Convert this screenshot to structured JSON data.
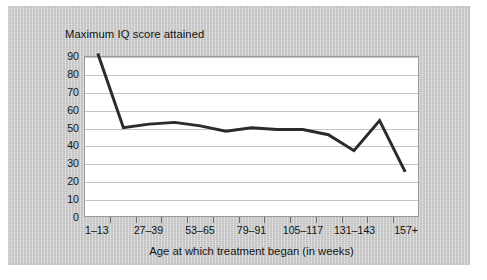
{
  "chart_data": {
    "type": "line",
    "title": "Maximum IQ score attained",
    "xlabel": "Age at which treatment began (in weeks)",
    "ylabel": "Maximum IQ score attained",
    "ylim": [
      0,
      90
    ],
    "ytick_step": 10,
    "yticks": [
      90,
      80,
      70,
      60,
      50,
      40,
      30,
      20,
      10,
      0
    ],
    "grid": true,
    "legend": "none",
    "line_color": "#2b2b2b",
    "line_width": 3,
    "categories": [
      "1–13",
      "14–26",
      "27–39",
      "40–52",
      "53–65",
      "66–78",
      "79–91",
      "92–104",
      "105–117",
      "118–130",
      "131–143",
      "144–156",
      "157+"
    ],
    "xtick_labels_visible": [
      "1–13",
      "27–39",
      "53–65",
      "79–91",
      "105–117",
      "131–143",
      "157+"
    ],
    "values": [
      92,
      50,
      52,
      53,
      51,
      48,
      50,
      49,
      49,
      46,
      37,
      54,
      25
    ],
    "series": [
      {
        "name": "Maximum IQ score attained",
        "values": [
          92,
          50,
          52,
          53,
          51,
          48,
          50,
          49,
          49,
          46,
          37,
          54,
          25
        ]
      }
    ],
    "points": [
      {
        "x": "1–13",
        "y": 92
      },
      {
        "x": "14–26",
        "y": 50
      },
      {
        "x": "27–39",
        "y": 52
      },
      {
        "x": "40–52",
        "y": 53
      },
      {
        "x": "53–65",
        "y": 51
      },
      {
        "x": "66–78",
        "y": 48
      },
      {
        "x": "79–91",
        "y": 50
      },
      {
        "x": "92–104",
        "y": 49
      },
      {
        "x": "105–117",
        "y": 49
      },
      {
        "x": "118–130",
        "y": 46
      },
      {
        "x": "131–143",
        "y": 37
      },
      {
        "x": "144–156",
        "y": 54
      },
      {
        "x": "157+",
        "y": 25
      }
    ]
  }
}
